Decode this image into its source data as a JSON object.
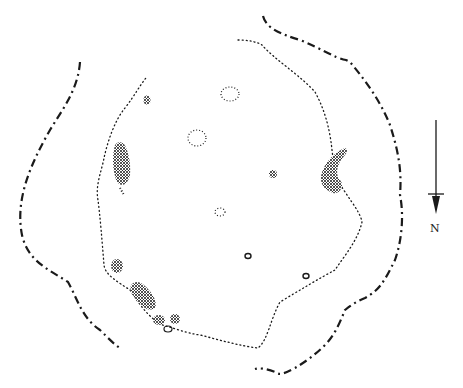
{
  "diagram": {
    "type": "archaeological-site-plan",
    "colors": {
      "ink": "#1a1a1a",
      "background": "#ffffff"
    },
    "north_arrow": {
      "label": "N",
      "direction": "down"
    },
    "features": {
      "outer_boundary": "dashed line",
      "inner_boundary": "dotted line",
      "stones_filled": 9,
      "pits_dotted_outline": 4,
      "postholes_solid_ring": 3
    }
  }
}
